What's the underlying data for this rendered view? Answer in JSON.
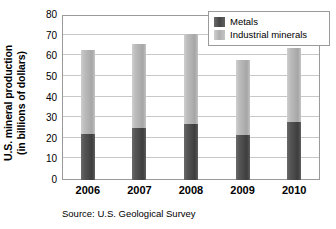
{
  "chart_data": {
    "type": "bar",
    "subtype": "stacked",
    "title": "",
    "xlabel": "",
    "ylabel": "U.S. mineral production (in billions of dollars)",
    "ylabel_line1": "U.S. mineral production",
    "ylabel_line2": "(in billions of dollars)",
    "categories": [
      "2006",
      "2007",
      "2008",
      "2009",
      "2010"
    ],
    "series": [
      {
        "name": "Metals",
        "values": [
          22.5,
          25,
          27,
          22,
          28
        ],
        "color": "#4a4a4a"
      },
      {
        "name": "Industrial minerals",
        "values": [
          40.5,
          41,
          44,
          36,
          36
        ],
        "color": "#b2b2b2"
      }
    ],
    "totals": [
      63,
      66,
      71,
      58,
      64
    ],
    "ylim": [
      0,
      80
    ],
    "yticks": [
      0,
      10,
      20,
      30,
      40,
      50,
      60,
      70,
      80
    ],
    "ytick_labels": [
      "0",
      "10",
      "20",
      "30",
      "40",
      "50",
      "60",
      "70",
      "80"
    ],
    "grid": true,
    "legend_position": "top-right",
    "source": "Source: U.S. Geological Survey"
  },
  "legend": {
    "entries": [
      {
        "label": "Metals",
        "swatch": "metals-swatch"
      },
      {
        "label": "Industrial minerals",
        "swatch": "industrial-minerals-swatch"
      }
    ]
  },
  "footer": {
    "source_text": "Source: U.S. Geological Survey"
  }
}
